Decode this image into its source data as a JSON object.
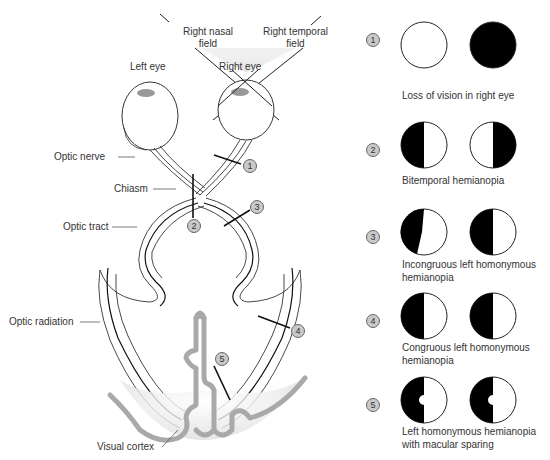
{
  "diagram": {
    "labels": {
      "right_nasal_field": "Right nasal\nfield",
      "right_nasal_field_l1": "Right nasal",
      "right_nasal_field_l2": "field",
      "right_temporal_field_l1": "Right temporal",
      "right_temporal_field_l2": "field",
      "left_eye": "Left eye",
      "right_eye": "Right eye",
      "optic_nerve": "Optic nerve",
      "chiasm": "Chiasm",
      "optic_tract": "Optic tract",
      "optic_radiation": "Optic radiation",
      "visual_cortex": "Visual cortex"
    },
    "lesion_markers": [
      "1",
      "2",
      "3",
      "4",
      "5"
    ],
    "colors": {
      "field_shade": "#d6d6d6",
      "cortex_gray": "#a9a9a9",
      "badge_fill": "#c9c9c9",
      "deficit_black": "#000000",
      "line": "#222222"
    }
  },
  "legend": {
    "items": [
      {
        "number": "1",
        "caption_l1": "Loss of vision in right eye",
        "caption_l2": "",
        "left_field": "full",
        "right_field": "blind"
      },
      {
        "number": "2",
        "caption_l1": "Bitemporal hemianopia",
        "caption_l2": "",
        "left_field": "left-half-blind",
        "right_field": "right-half-blind"
      },
      {
        "number": "3",
        "caption_l1": "Incongruous left homonymous",
        "caption_l2": "hemianopia",
        "left_field": "left-half-blind-incongruous",
        "right_field": "left-half-blind"
      },
      {
        "number": "4",
        "caption_l1": "Congruous left homonymous",
        "caption_l2": "hemianopia",
        "left_field": "left-half-blind",
        "right_field": "left-half-blind"
      },
      {
        "number": "5",
        "caption_l1": "Left homonymous hemianopia",
        "caption_l2": "with macular sparing",
        "left_field": "left-half-blind-macular-sparing",
        "right_field": "left-half-blind-macular-sparing"
      }
    ]
  }
}
